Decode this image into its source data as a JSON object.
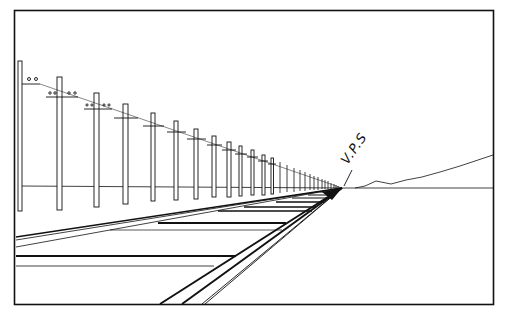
{
  "figure": {
    "type": "one-point perspective drawing",
    "annotation_label": "V.P.S",
    "colors": {
      "ink": "#111111",
      "paper": "#ffffff"
    }
  }
}
